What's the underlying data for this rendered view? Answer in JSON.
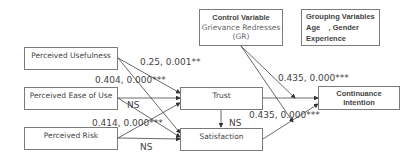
{
  "boxes": {
    "perceived_usefulness": "Perceived Usefulness",
    "perceived_ease_of_use": "Perceived Ease of Use",
    "perceived_risk": "Perceived Risk",
    "trust": "Trust",
    "satisfaction": "Satisfaction",
    "continuance_intention_line1": "Continuance",
    "continuance_intention_line2": "Intention",
    "control_variable_title": "Control Variable",
    "control_variable_line1": "Grievance Redresses",
    "control_variable_line2": "(GR)",
    "grouping_variables_title": "Grouping Variables",
    "grouping_variables_line1": "Age    , Gender",
    "grouping_variables_line2": "Experience"
  },
  "paths": {
    "pu_label": "0.25, 0.001**",
    "peou_label": "0.404, 0.000***",
    "peou_ns": "NS",
    "pr_label": "0.414, 0.000***",
    "pr_ns": "NS",
    "trust_sat_ns": "NS",
    "trust_ci_label": "0.435, 0.000***",
    "sat_ci_label": "0.435, 0.000***"
  }
}
